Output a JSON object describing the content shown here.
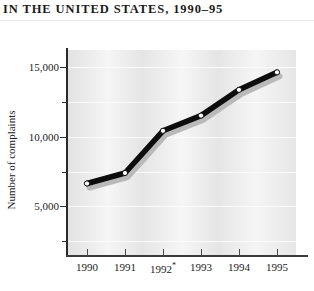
{
  "chart_data": {
    "type": "line",
    "title": "IN THE UNITED STATES, 1990–95",
    "subtitle": "",
    "xlabel": "",
    "ylabel": "Number of complaints",
    "categories": [
      "1990",
      "1991",
      "1992*",
      "1993",
      "1994",
      "1995"
    ],
    "x_tick_labels": [
      "1990",
      "1991",
      "1992*",
      "1993",
      "1994",
      "1995"
    ],
    "y_tick_labels": [
      "5,000",
      "10,000",
      "15,000"
    ],
    "y_tick_values": [
      5000,
      10000,
      15000
    ],
    "y_minor_ticks": [
      2500,
      7500,
      12500,
      17500
    ],
    "ylim": [
      0,
      17500
    ],
    "xlim": [
      "1990",
      "1995"
    ],
    "grid": true,
    "legend": null,
    "annotations": [
      "1992 label carries an asterisk footnote marker"
    ],
    "series": [
      {
        "name": "Number of complaints",
        "values": [
          6100,
          7000,
          10600,
          11900,
          14100,
          15600
        ],
        "marker": "open-circle",
        "line_color": "#0d0d0d",
        "marker_face": "#ffffff",
        "shadow_color": "#b9b9b9"
      }
    ]
  },
  "chart": {
    "title": "IN THE UNITED STATES, 1990–95",
    "ylabel": "Number of complaints",
    "y_ticks": [
      {
        "label": "15,000",
        "value": 15000
      },
      {
        "label": "10,000",
        "value": 10000
      },
      {
        "label": "5,000",
        "value": 5000
      }
    ],
    "x_ticks": [
      {
        "label": "1990",
        "note": ""
      },
      {
        "label": "1991",
        "note": ""
      },
      {
        "label": "1992",
        "note": "*"
      },
      {
        "label": "1993",
        "note": ""
      },
      {
        "label": "1994",
        "note": ""
      },
      {
        "label": "1995",
        "note": ""
      }
    ],
    "colors": {
      "line": "#0d0d0d",
      "shadow": "#b9b9b9",
      "marker_fill": "#ffffff",
      "plot_background": "#efefef",
      "gridline": "#fbfbfb",
      "axis": "#2a2a2a",
      "text": "#1b1b1b"
    }
  }
}
